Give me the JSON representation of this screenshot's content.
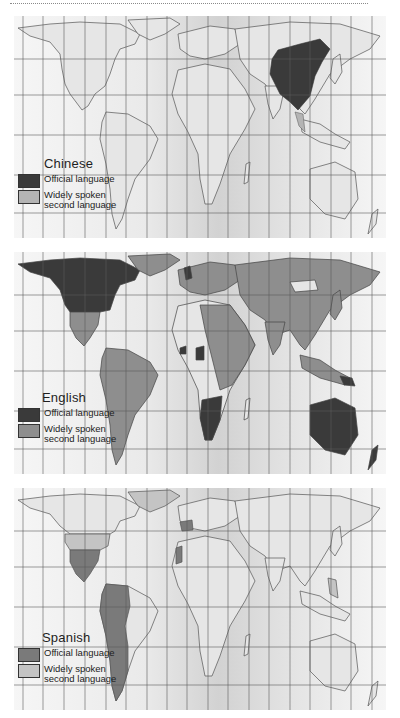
{
  "figure": {
    "colors": {
      "land": "#e6e6e6",
      "ocean_light": "#f4f4f4",
      "ocean_mid": "#d9d9d9",
      "border": "#555555",
      "grid": "#5a5a5a"
    }
  },
  "maps": [
    {
      "language": "Chinese",
      "legend": {
        "title": "Chinese",
        "items": [
          {
            "label": "Official language",
            "color": "#3a3a3a"
          },
          {
            "label": "Widely spoken second language",
            "label_line1": "Widely spoken",
            "label_line2": "second language",
            "color": "#b4b4b4"
          }
        ]
      },
      "official_regions": [
        "China",
        "Taiwan",
        "Singapore"
      ],
      "second_language_regions": [
        "Malaysia",
        "Thailand (partial)"
      ]
    },
    {
      "language": "English",
      "legend": {
        "title": "English",
        "items": [
          {
            "label": "Official language",
            "color": "#3a3a3a"
          },
          {
            "label": "Widely spoken second language",
            "label_line1": "Widely spoken",
            "label_line2": "second language",
            "color": "#8e8e8e"
          }
        ]
      },
      "official_regions": [
        "Canada",
        "United States",
        "United Kingdom",
        "Ireland",
        "Australia",
        "New Zealand",
        "South Africa",
        "Namibia",
        "Botswana",
        "Zimbabwe",
        "Zambia",
        "Nigeria",
        "Ghana",
        "Sierra Leone",
        "Liberia",
        "Uganda",
        "Kenya",
        "Papua New Guinea",
        "Guyana",
        "Philippines"
      ],
      "second_language_regions": [
        "Europe",
        "Russia",
        "China",
        "India",
        "Middle East",
        "South America",
        "Central America",
        "Mexico",
        "North Africa",
        "East Africa",
        "Southeast Asia",
        "Japan",
        "Greenland",
        "Indonesia"
      ]
    },
    {
      "language": "Spanish",
      "legend": {
        "title": "Spanish",
        "items": [
          {
            "label": "Official language",
            "color": "#7a7a7a"
          },
          {
            "label": "Widely spoken second language",
            "label_line1": "Widely spoken",
            "label_line2": "second language",
            "color": "#c4c4c4"
          }
        ]
      },
      "official_regions": [
        "Spain",
        "Mexico",
        "Central America",
        "Cuba",
        "Colombia",
        "Venezuela",
        "Ecuador",
        "Peru",
        "Bolivia",
        "Chile",
        "Argentina",
        "Paraguay",
        "Uruguay",
        "Western Sahara",
        "Equatorial Guinea"
      ],
      "second_language_regions": [
        "United States",
        "Greenland",
        "Philippines"
      ]
    }
  ]
}
